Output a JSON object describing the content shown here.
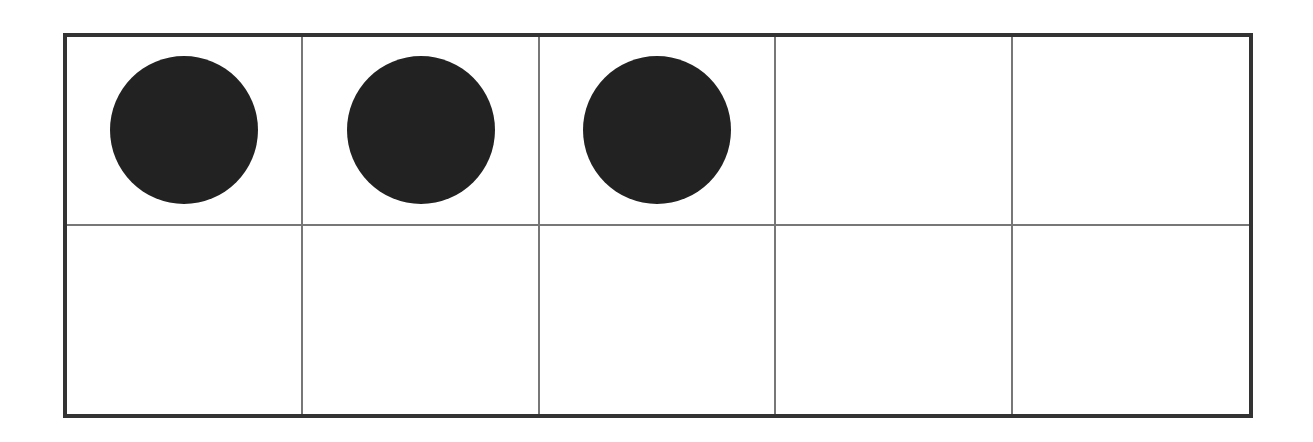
{
  "diagram": {
    "type": "ten-frame",
    "rows": 2,
    "columns": 5,
    "filled_count": 3,
    "cells": [
      {
        "filled": true
      },
      {
        "filled": true
      },
      {
        "filled": true
      },
      {
        "filled": false
      },
      {
        "filled": false
      },
      {
        "filled": false
      },
      {
        "filled": false
      },
      {
        "filled": false
      },
      {
        "filled": false
      },
      {
        "filled": false
      }
    ],
    "colors": {
      "border": "#333333",
      "grid": "#777777",
      "counter": "#222222",
      "background": "#ffffff"
    }
  }
}
